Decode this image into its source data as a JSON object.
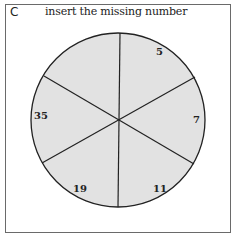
{
  "panel": {
    "label": "C",
    "title": "insert the missing number"
  },
  "puzzle": {
    "segments": [
      {
        "position": "top-right",
        "value": "5"
      },
      {
        "position": "right",
        "value": "7"
      },
      {
        "position": "bottom-right",
        "value": "11"
      },
      {
        "position": "bottom-left",
        "value": "19"
      },
      {
        "position": "left",
        "value": "35"
      },
      {
        "position": "top-left",
        "value": ""
      }
    ],
    "fill_color": "#e2e2e2",
    "line_color": "#222222"
  }
}
